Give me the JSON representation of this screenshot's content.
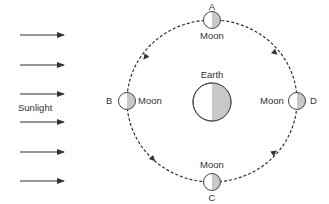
{
  "sunlight": {
    "label": "Sunlight",
    "arrow_count": 6,
    "arrow_ys": [
      35,
      65,
      94,
      122,
      152,
      181
    ]
  },
  "earth": {
    "label": "Earth",
    "lit_color": "#ffffff",
    "shadow_color": "#c8c8c8"
  },
  "moons": {
    "A": {
      "letter": "A",
      "label": "Moon"
    },
    "B": {
      "letter": "B",
      "label": "Moon"
    },
    "C": {
      "letter": "C",
      "label": "Moon"
    },
    "D": {
      "letter": "D",
      "label": "Moon"
    }
  },
  "orbit": {
    "style": "dashed",
    "direction": "counterclockwise",
    "color": "#333333"
  }
}
